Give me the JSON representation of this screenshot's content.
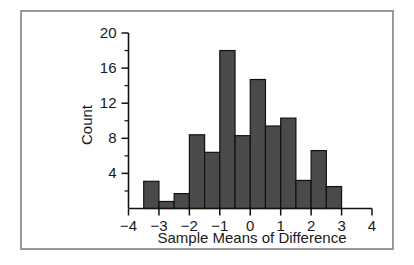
{
  "figure": {
    "frame_color": "#9a9a9a",
    "background_color": "#ffffff"
  },
  "chart_data": {
    "type": "bar",
    "title": "",
    "subtitle": "",
    "xlabel": "Sample Means of Difference",
    "ylabel": "Count",
    "xlim": [
      -4,
      4
    ],
    "ylim": [
      0,
      20
    ],
    "bin_width": 0.5,
    "grid": false,
    "legend": null,
    "bar_color": "#4a4a4a",
    "bar_edge_color": "#111111",
    "x_tick_labels": [
      "-4",
      "-3",
      "-2",
      "-1",
      "0",
      "1",
      "2",
      "3",
      "4"
    ],
    "x_tick_values": [
      -4,
      -3,
      -2,
      -1,
      0,
      1,
      2,
      3,
      4
    ],
    "y_tick_labels": [
      "4",
      "8",
      "12",
      "16",
      "20"
    ],
    "y_tick_values": [
      4,
      8,
      12,
      16,
      20
    ],
    "y_minor_ticks": [
      2,
      6,
      10,
      14,
      18
    ],
    "bins": [
      {
        "x0": -3.5,
        "x1": -3.0,
        "count": 3.1
      },
      {
        "x0": -3.0,
        "x1": -2.5,
        "count": 0.8
      },
      {
        "x0": -2.5,
        "x1": -2.0,
        "count": 1.7
      },
      {
        "x0": -2.0,
        "x1": -1.5,
        "count": 8.4
      },
      {
        "x0": -1.5,
        "x1": -1.0,
        "count": 6.4
      },
      {
        "x0": -1.0,
        "x1": -0.5,
        "count": 18.0
      },
      {
        "x0": -0.5,
        "x1": 0.0,
        "count": 8.3
      },
      {
        "x0": 0.0,
        "x1": 0.5,
        "count": 14.7
      },
      {
        "x0": 0.5,
        "x1": 1.0,
        "count": 9.4
      },
      {
        "x0": 1.0,
        "x1": 1.5,
        "count": 10.3
      },
      {
        "x0": 1.5,
        "x1": 2.0,
        "count": 3.2
      },
      {
        "x0": 2.0,
        "x1": 2.5,
        "count": 6.6
      },
      {
        "x0": 2.5,
        "x1": 3.0,
        "count": 2.5
      }
    ],
    "categories": [
      "-3.5",
      "-3.0",
      "-2.5",
      "-2.0",
      "-1.5",
      "-1.0",
      "-0.5",
      "0.0",
      "0.5",
      "1.0",
      "1.5",
      "2.0",
      "2.5"
    ],
    "values": [
      3.1,
      0.8,
      1.7,
      8.4,
      6.4,
      18.0,
      8.3,
      14.7,
      9.4,
      10.3,
      3.2,
      6.6,
      2.5
    ]
  }
}
